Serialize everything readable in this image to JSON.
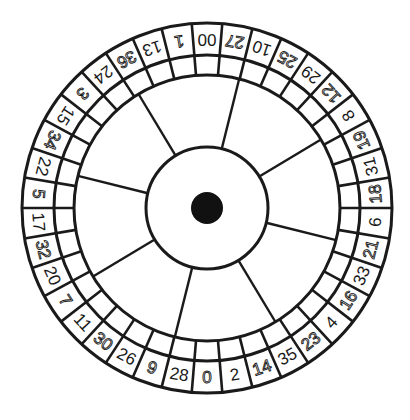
{
  "wheel": {
    "title": "American roulette wheel (double zero)",
    "center": [
      207,
      208
    ],
    "radii": {
      "outer": 185,
      "number_ring_inner": 153,
      "pocket_ring_inner": 133,
      "hub": 61,
      "center_dot": 16
    },
    "start_angle_deg": 0,
    "spoke_count": 8,
    "spoke_offset_deg": 14,
    "colors": {
      "line": "#1a1a1a",
      "background": "#ffffff",
      "center_dot": "#111111"
    },
    "pockets": [
      {
        "label": "00",
        "style": "solid"
      },
      {
        "label": "27",
        "style": "outline"
      },
      {
        "label": "10",
        "style": "solid"
      },
      {
        "label": "25",
        "style": "outline"
      },
      {
        "label": "29",
        "style": "solid"
      },
      {
        "label": "12",
        "style": "outline"
      },
      {
        "label": "8",
        "style": "solid"
      },
      {
        "label": "19",
        "style": "outline"
      },
      {
        "label": "31",
        "style": "solid"
      },
      {
        "label": "18",
        "style": "outline"
      },
      {
        "label": "6",
        "style": "solid"
      },
      {
        "label": "21",
        "style": "outline"
      },
      {
        "label": "33",
        "style": "solid"
      },
      {
        "label": "16",
        "style": "outline"
      },
      {
        "label": "4",
        "style": "solid"
      },
      {
        "label": "23",
        "style": "outline"
      },
      {
        "label": "35",
        "style": "solid"
      },
      {
        "label": "14",
        "style": "outline"
      },
      {
        "label": "2",
        "style": "solid"
      },
      {
        "label": "0",
        "style": "outline"
      },
      {
        "label": "28",
        "style": "solid"
      },
      {
        "label": "9",
        "style": "outline"
      },
      {
        "label": "26",
        "style": "solid"
      },
      {
        "label": "30",
        "style": "outline"
      },
      {
        "label": "11",
        "style": "solid"
      },
      {
        "label": "7",
        "style": "outline"
      },
      {
        "label": "20",
        "style": "solid"
      },
      {
        "label": "32",
        "style": "outline"
      },
      {
        "label": "17",
        "style": "solid"
      },
      {
        "label": "5",
        "style": "outline"
      },
      {
        "label": "22",
        "style": "solid"
      },
      {
        "label": "34",
        "style": "outline"
      },
      {
        "label": "15",
        "style": "solid"
      },
      {
        "label": "3",
        "style": "outline"
      },
      {
        "label": "24",
        "style": "solid"
      },
      {
        "label": "36",
        "style": "outline"
      },
      {
        "label": "13",
        "style": "solid"
      },
      {
        "label": "1",
        "style": "outline"
      }
    ]
  }
}
